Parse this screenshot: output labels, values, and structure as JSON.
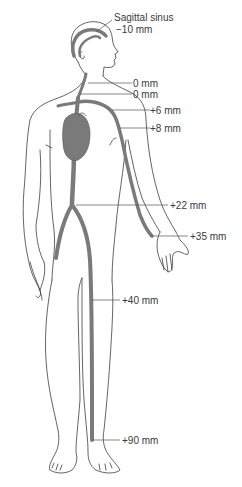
{
  "diagram": {
    "type": "anatomical-figure",
    "colors": {
      "outline": "#3c3c3c",
      "vein": "#7a7a7a",
      "heart": "#7a7a7a",
      "text": "#3a3a3a",
      "background": "#ffffff"
    },
    "labels": [
      {
        "id": "sagittal-sinus-title",
        "text": "Sagittal sinus"
      },
      {
        "id": "sagittal-sinus",
        "text": "−10 mm"
      },
      {
        "id": "neck-upper",
        "text": "0 mm"
      },
      {
        "id": "neck-lower",
        "text": "0 mm"
      },
      {
        "id": "subclavian",
        "text": "+6 mm"
      },
      {
        "id": "upper-arm",
        "text": "+8 mm"
      },
      {
        "id": "abdomen",
        "text": "+22 mm"
      },
      {
        "id": "wrist",
        "text": "+35 mm"
      },
      {
        "id": "thigh",
        "text": "+40 mm"
      },
      {
        "id": "ankle",
        "text": "+90 mm"
      }
    ]
  }
}
